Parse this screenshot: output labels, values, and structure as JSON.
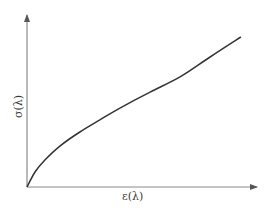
{
  "chart_data": {
    "type": "line",
    "title": "",
    "xlabel": "ε(λ)",
    "ylabel": "σ(λ)",
    "grid": false,
    "legend": null,
    "ticks": false,
    "xlim": [
      0,
      1
    ],
    "ylim": [
      0,
      1
    ],
    "series": [
      {
        "name": "σ vs ε",
        "x": [
          0.0,
          0.035,
          0.078,
          0.143,
          0.23,
          0.317,
          0.404,
          0.535,
          0.665,
          0.796,
          0.93
        ],
        "y": [
          0.0,
          0.087,
          0.157,
          0.238,
          0.32,
          0.39,
          0.459,
          0.552,
          0.64,
          0.756,
          0.872
        ]
      }
    ]
  },
  "colors": {
    "axis": "#8a8a8a",
    "curve": "#333333",
    "background": "#ffffff"
  }
}
